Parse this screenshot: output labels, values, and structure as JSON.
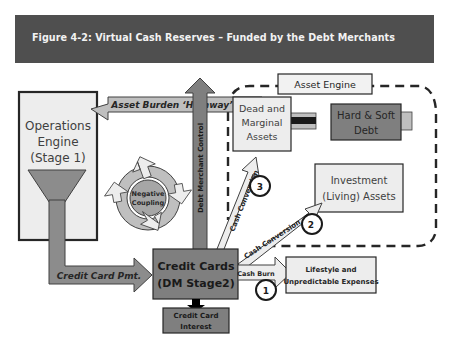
{
  "figure": {
    "title": "Figure 4-2: Virtual Cash Reserves – Funded by the Debt Merchants"
  },
  "diagram": {
    "nodes": {
      "operations_engine": {
        "line1": "Operations",
        "line2": "Engine",
        "line3": "(Stage 1)"
      },
      "asset_engine_label": "Asset Engine",
      "dead_assets": {
        "line1": "Dead and",
        "line2": "Marginal",
        "line3": "Assets"
      },
      "hard_soft_debt": {
        "line1": "Hard & Soft",
        "line2": "Debt"
      },
      "investment_assets": {
        "line1": "Investment",
        "line2": "(Living) Assets"
      },
      "negative_coupling": {
        "line1": "Negative",
        "line2": "Coupling"
      },
      "credit_cards": {
        "line1": "Credit Cards",
        "line2": "(DM Stage2)"
      },
      "credit_card_interest": {
        "line1": "Credit Card",
        "line2": "Interest"
      },
      "lifestyle_expenses": {
        "line1": "Lifestyle and",
        "line2": "Unpredictable Expenses"
      }
    },
    "edges": {
      "asset_burden_highway": "Asset Burden ‘Highway’",
      "debt_merchant_control": "Debt Merchant Control",
      "cash_conversion_3": "Cash Conversion",
      "cash_conversion_2": "Cash Conversion",
      "cash_burn": "Cash Burn",
      "credit_card_pmt": "Credit Card Pmt."
    },
    "markers": {
      "m1": "1",
      "m2": "2",
      "m3": "3"
    },
    "colors": {
      "banner": "#4f4f4f",
      "light_fill": "#ededed",
      "mid_fill": "#a6a6a6",
      "dark_fill": "#7f7f7f",
      "darker_fill": "#6f6f6f",
      "outline": "#262626"
    }
  }
}
